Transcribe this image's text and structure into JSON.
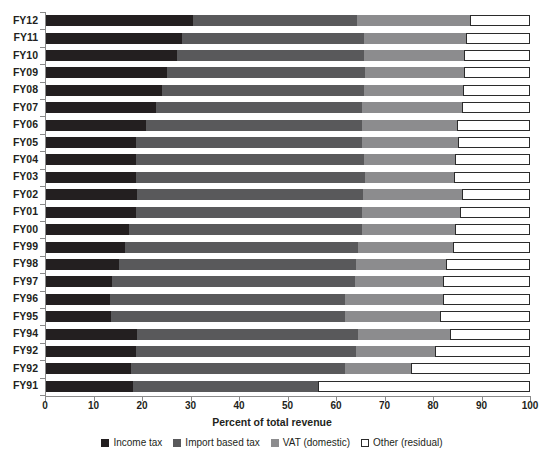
{
  "chart_data": {
    "type": "bar",
    "orientation": "horizontal",
    "stacked": true,
    "normalized": true,
    "title": "",
    "xlabel": "Percent of total revenue",
    "ylabel": "",
    "xlim": [
      0,
      100
    ],
    "xticks": [
      0,
      10,
      20,
      30,
      40,
      50,
      60,
      70,
      80,
      90,
      100
    ],
    "grid": false,
    "legend_position": "bottom",
    "categories": [
      "FY12",
      "FY11",
      "FY10",
      "FY09",
      "FY08",
      "FY07",
      "FY06",
      "FY05",
      "FY04",
      "FY03",
      "FY02",
      "FY01",
      "FY00",
      "FY99",
      "FY98",
      "FY97",
      "FY96",
      "FY95",
      "FY94",
      "FY92",
      "FY92",
      "FY91"
    ],
    "series": [
      {
        "name": "Income tax",
        "color": "#231f20",
        "values": [
          30.4,
          28.2,
          27.0,
          25.0,
          24.0,
          22.8,
          20.6,
          18.6,
          18.6,
          18.6,
          18.8,
          18.6,
          17.2,
          16.4,
          15.0,
          13.6,
          13.2,
          13.4,
          18.8,
          18.6,
          17.6,
          18.0
        ]
      },
      {
        "name": "Import based tax",
        "color": "#59595b",
        "values": [
          33.9,
          37.6,
          38.8,
          41.0,
          41.6,
          42.4,
          44.6,
          46.6,
          47.2,
          47.4,
          46.6,
          46.6,
          48.0,
          48.0,
          49.0,
          50.2,
          48.6,
          48.4,
          45.6,
          45.4,
          44.2,
          38.2
        ]
      },
      {
        "name": "VAT (domestic)",
        "color": "#8c8c8e",
        "values": [
          23.3,
          21.0,
          20.6,
          20.4,
          20.6,
          20.8,
          19.8,
          20.0,
          18.8,
          18.4,
          20.6,
          20.4,
          19.4,
          19.6,
          18.6,
          18.2,
          20.2,
          19.6,
          19.0,
          16.4,
          13.6,
          0.0
        ]
      },
      {
        "name": "Other (residual)",
        "color": "#ffffff",
        "values": [
          12.4,
          13.2,
          13.6,
          13.6,
          13.8,
          14.0,
          15.0,
          14.8,
          15.4,
          15.6,
          14.0,
          14.4,
          15.4,
          16.0,
          17.4,
          18.0,
          18.0,
          18.6,
          16.6,
          19.6,
          24.6,
          43.8
        ]
      }
    ],
    "legend": [
      {
        "label": "Income tax",
        "color": "#231f20",
        "style": "filled"
      },
      {
        "label": "Import based tax",
        "color": "#59595b",
        "style": "filled"
      },
      {
        "label": "VAT (domestic)",
        "color": "#8c8c8e",
        "style": "filled"
      },
      {
        "label": "Other (residual)",
        "color": "#ffffff",
        "style": "outline"
      }
    ]
  }
}
